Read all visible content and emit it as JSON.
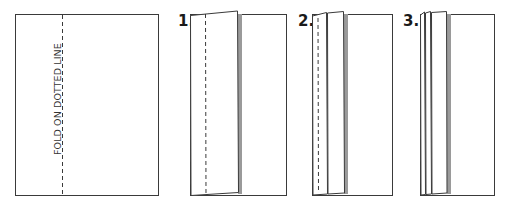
{
  "diagram": {
    "instruction_text": "FOLD ON DOTTED LINE",
    "steps": [
      {
        "label": "1."
      },
      {
        "label": "2."
      },
      {
        "label": "3."
      }
    ],
    "colors": {
      "stroke": "#3a3a3a",
      "shadow": "#9a9a9a",
      "paper": "#ffffff"
    }
  }
}
